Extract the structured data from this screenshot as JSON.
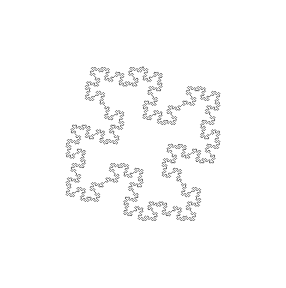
{
  "figure": {
    "kind": "fractal-curve",
    "line_color": "#5a5a5a",
    "background_color": "#ffffff",
    "lsystem": {
      "axiom": "F+F+F+F",
      "rules": {
        "F": "F+F-F-FF+F+F-F"
      },
      "angle_degrees": 90,
      "iterations": 3
    }
  }
}
